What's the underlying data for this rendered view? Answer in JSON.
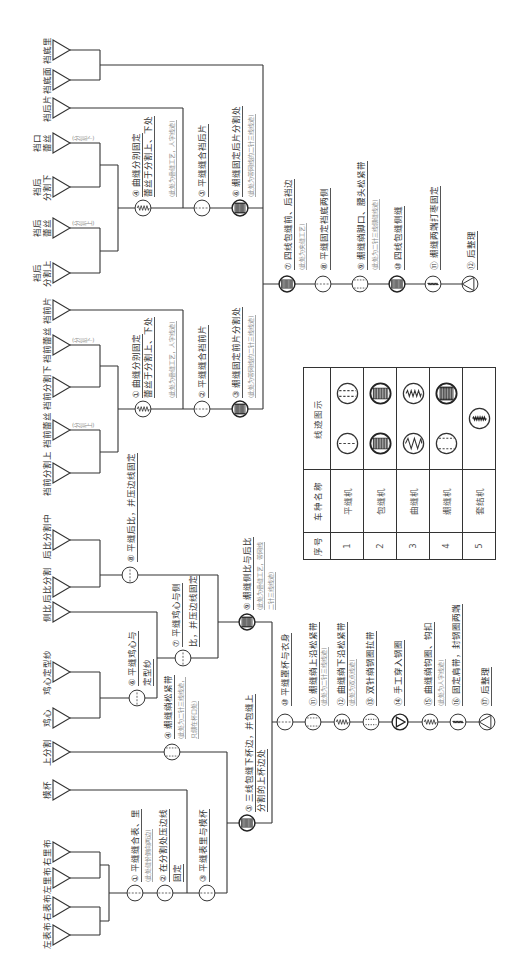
{
  "diagram": {
    "panties": {
      "inputs": [
        {
          "lines": [
            "裆前分割上"
          ]
        },
        {
          "lines": [
            "裆前蕾丝"
          ],
          "note": "(分割上)"
        },
        {
          "lines": [
            "裆前分割下"
          ]
        },
        {
          "lines": [
            "裆前蕾丝"
          ],
          "note": "(分割下)"
        },
        {
          "lines": [
            "裆前片"
          ]
        },
        {
          "lines": [
            "裆后",
            "分割上"
          ]
        },
        {
          "lines": [
            "裆后",
            "蕾丝"
          ],
          "note": "(分割上)"
        },
        {
          "lines": [
            "裆后",
            "分割下"
          ]
        },
        {
          "lines": [
            "裆口",
            "蕾丝"
          ],
          "note": "(分割下)"
        },
        {
          "lines": [
            "裆后片"
          ]
        },
        {
          "lines": [
            "裆底面"
          ]
        },
        {
          "lines": [
            "裆底里"
          ]
        }
      ],
      "steps": [
        {
          "icon": "zigzag-stitch-icon",
          "lines": [
            "① 曲缝分别固定",
            "蕾丝于分割上、下处"
          ],
          "notes": [
            "(此处为叠缝工艺，人字线迹)"
          ]
        },
        {
          "icon": "lockstitch-icon",
          "lines": [
            "② 平缝缝合裆前片"
          ]
        },
        {
          "icon": "coverstitch-net-icon",
          "lines": [
            "③ 绷缝固定前片分割处"
          ],
          "notes": [
            "(此处为带网线的二针三线线迹)"
          ]
        },
        {
          "icon": "zigzag-stitch-icon",
          "lines": [
            "④ 曲缝分别固定",
            "蕾丝于分割上、下处"
          ],
          "notes": [
            "(此处为叠缝工艺，人字线迹)"
          ]
        },
        {
          "icon": "lockstitch-icon",
          "lines": [
            "⑤ 平缝缝合裆后片"
          ]
        },
        {
          "icon": "coverstitch-net-icon",
          "lines": [
            "⑥ 绷缝固定后片分割处"
          ],
          "notes": [
            "(此处为带网线的二针三线线迹)"
          ]
        },
        {
          "icon": "overlock-stitch-icon",
          "lines": [
            "⑦ 四线包缝前、后裆边"
          ],
          "notes": [
            "(此处为夹缝工艺)"
          ]
        },
        {
          "icon": "lockstitch-icon",
          "lines": [
            "⑧ 平缝固定裆底两侧"
          ]
        },
        {
          "icon": "coverstitch-icon",
          "lines": [
            "⑨ 绷缝绱脚口、腰头松紧带"
          ],
          "notes": [
            "(此处为二针三线绷缝线迹)"
          ]
        },
        {
          "icon": "overlock-stitch-icon",
          "lines": [
            "⑩ 四线包缝侧缝"
          ]
        },
        {
          "icon": "bartack-icon",
          "lines": [
            "⑪ 绷缝两端打枣固定"
          ]
        },
        {
          "icon": "finishing-icon",
          "lines": [
            "⑫ 后整理"
          ]
        }
      ]
    },
    "bra": {
      "inputs": [
        {
          "lines": [
            "左表布"
          ]
        },
        {
          "lines": [
            "右表布"
          ]
        },
        {
          "lines": [
            "左里布"
          ]
        },
        {
          "lines": [
            "右里布"
          ]
        },
        {
          "lines": [
            "模杯"
          ]
        },
        {
          "lines": [
            "上分割"
          ]
        },
        {
          "lines": [
            "鸡心"
          ]
        },
        {
          "lines": [
            "鸡心定型纱"
          ]
        },
        {
          "lines": [
            "侧比"
          ]
        },
        {
          "lines": [
            "后比分割"
          ]
        },
        {
          "lines": [
            "后比分割中"
          ]
        }
      ],
      "steps": [
        {
          "icon": "lockstitch-icon",
          "lines": [
            "① 平缝缝合表、里"
          ],
          "notes": [
            "(此处缝份倒向两边)"
          ]
        },
        {
          "icon": "lockstitch-icon",
          "lines": [
            "② 在分割处压边线",
            "固定"
          ]
        },
        {
          "icon": "lockstitch-icon",
          "lines": [
            "③ 平缝表里与模杯"
          ]
        },
        {
          "icon": "coverstitch-icon",
          "lines": [
            "④ 绷缝绱松紧带"
          ],
          "notes": [
            "(此处为二针三线线迹，",
            "只绷在杯口处)"
          ]
        },
        {
          "icon": "overlock-stitch-icon",
          "lines": [
            "⑤ 三线包缝下杯边，并包缝上",
            "分割的上杯边处"
          ]
        },
        {
          "icon": "lockstitch-cross-icon",
          "lines": [
            "⑥ 平缝鸡心与",
            "定型纱"
          ]
        },
        {
          "icon": "lockstitch-cross-icon",
          "lines": [
            "⑦ 平缝鸡心与侧",
            "比，并压边线固定"
          ]
        },
        {
          "icon": "lockstitch-cross-icon",
          "lines": [
            "⑧ 平缝后比，并压边线固定"
          ]
        },
        {
          "icon": "coverstitch-net-icon",
          "lines": [
            "⑨ 绷缝侧比与后比"
          ],
          "notes": [
            "(此处为叠缝工艺，带网线",
            "二针三线线迹)"
          ]
        },
        {
          "icon": "lockstitch-icon",
          "lines": [
            "⑩ 平缝罩杯与衣身"
          ]
        },
        {
          "icon": "coverstitch-icon",
          "lines": [
            "⑪ 绷缝绱上沿松紧带"
          ],
          "notes": [
            "(此处为二针三线线迹)"
          ]
        },
        {
          "icon": "zigzag-stitch-icon",
          "lines": [
            "⑫ 曲缝绱下沿松紧带"
          ],
          "notes": [
            "(此处为双点线迹)"
          ]
        },
        {
          "icon": "double-needle-icon",
          "lines": [
            "⑬ 双针绱钢圈拉带"
          ]
        },
        {
          "icon": "manual-icon",
          "lines": [
            "⑭ 手工穿入钢圈"
          ]
        },
        {
          "icon": "zigzag-stitch-icon",
          "lines": [
            "⑮ 曲缝绱钩圈、钩扣"
          ],
          "notes": [
            "(此处为人字线迹)"
          ]
        },
        {
          "icon": "bartack-icon",
          "lines": [
            "⑯ 固定肩带，封钢圈两端"
          ]
        },
        {
          "icon": "finishing-icon",
          "lines": [
            "⑰ 后整理"
          ]
        }
      ]
    },
    "legend": {
      "headers": [
        "序号",
        "车种名称",
        "线迹图示"
      ],
      "rows": [
        {
          "no": "1",
          "machine": "平缝机",
          "icons": [
            "lockstitch-icon",
            "double-lockstitch-icon"
          ]
        },
        {
          "no": "2",
          "machine": "包缝机",
          "icons": [
            "overlock-stitch-icon",
            "overlock-stitch-icon"
          ]
        },
        {
          "no": "3",
          "machine": "曲缝机",
          "icons": [
            "zigzag-wide-icon",
            "zigzag-stitch-icon"
          ]
        },
        {
          "no": "4",
          "machine": "绷缝机",
          "icons": [
            "coverstitch-icon",
            "coverstitch-net-icon"
          ]
        },
        {
          "no": "5",
          "machine": "套结机",
          "icons": [
            "bartack-icon"
          ]
        }
      ]
    },
    "colors": {
      "line": "#333333",
      "text": "#333333",
      "note": "#8a8a8a",
      "background": "#ffffff"
    }
  }
}
